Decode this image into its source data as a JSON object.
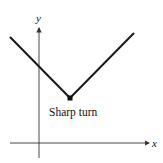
{
  "diagram": {
    "type": "graph",
    "axes": {
      "x_label": "x",
      "y_label": "y"
    },
    "annotation": "Sharp turn",
    "colors": {
      "line": "#1a1a1a",
      "axis": "#333333",
      "background": "#ffffff"
    }
  }
}
